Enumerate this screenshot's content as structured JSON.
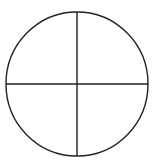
{
  "diagram": {
    "type": "circle-quadrants",
    "circle": {
      "cx": 77,
      "cy": 84,
      "rx": 71,
      "ry": 72
    },
    "lines": [
      {
        "name": "vertical-diameter",
        "x1": 77,
        "y1": 12,
        "x2": 77,
        "y2": 156
      },
      {
        "name": "horizontal-diameter",
        "x1": 6,
        "y1": 84,
        "x2": 148,
        "y2": 84
      }
    ],
    "quadrant_count": 4,
    "colors": {
      "stroke": "#222222",
      "background": "#ffffff"
    }
  }
}
